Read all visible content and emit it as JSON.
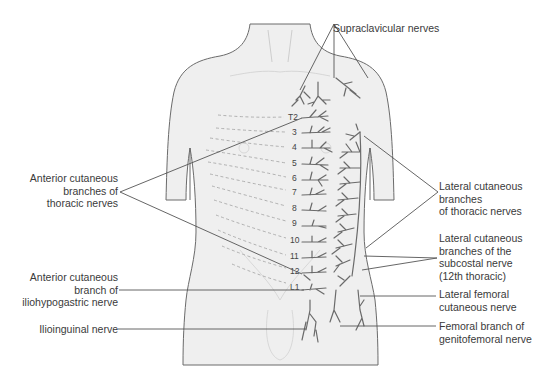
{
  "diagram": {
    "type": "anatomical-dermatome-nerve-map",
    "colors": {
      "body_fill": "#efefef",
      "body_outline": "#6b6b6b",
      "nerve": "#6a6a6a",
      "leader_line": "#555555",
      "dashed_dermatome": "#a8a8a8",
      "text": "#3a3a3a"
    },
    "spinal_levels": [
      "T2",
      "3",
      "4",
      "5",
      "6",
      "7",
      "8",
      "9",
      "10",
      "11",
      "12",
      "L1"
    ],
    "labels": {
      "supraclavicular": "Supraclavicular nerves",
      "anterior_cutaneous_thoracic": [
        "Anterior cutaneous",
        "branches of",
        "thoracic nerves"
      ],
      "lateral_cutaneous_thoracic": [
        "Lateral cutaneous",
        "branches",
        "of thoracic nerves"
      ],
      "lateral_cutaneous_subcostal": [
        "Lateral cutaneous",
        "branches of the",
        "subcostal nerve",
        "(12th thoracic)"
      ],
      "anterior_cutaneous_iliohypogastric": [
        "Anterior cutaneous",
        "branch of",
        "iliohypogastric nerve"
      ],
      "lateral_femoral_cutaneous": [
        "Lateral femoral",
        "cutaneous nerve"
      ],
      "ilioinguinal": "Ilioinguinal nerve",
      "femoral_branch_genitofemoral": [
        "Femoral branch of",
        "genitofemoral nerve"
      ]
    }
  }
}
